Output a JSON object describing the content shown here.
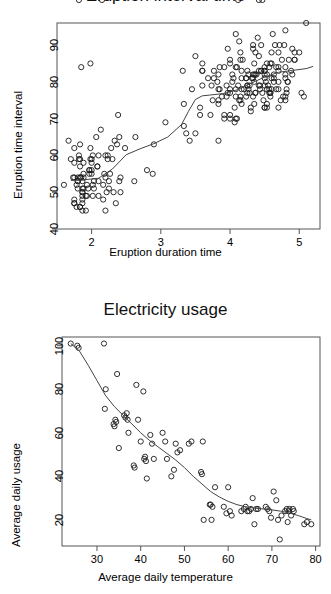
{
  "page": {
    "background": "#ffffff",
    "point_color": "#1a1a1a",
    "line_color": "#444444",
    "axis_color": "#555555",
    "width": 331,
    "height": 594
  },
  "figures": [
    {
      "id": "eruption-figure",
      "title": "Eruption interval time",
      "title_clipped": true
    },
    {
      "id": "electricity-figure",
      "title": "Electricity usage",
      "title_clipped": false
    }
  ],
  "chart_data": [
    {
      "type": "scatter",
      "title": "Eruption interval time",
      "xlabel": "Eruption duration time",
      "ylabel": "Eruption time interval",
      "xlim": [
        1.5,
        5.3
      ],
      "ylim": [
        40,
        96
      ],
      "xticks": [
        2,
        3,
        4,
        5
      ],
      "yticks": [
        40,
        50,
        60,
        70,
        80,
        90
      ],
      "grid": false,
      "legend": "none",
      "marker": "open-circle",
      "overlay": {
        "type": "line",
        "name": "lowess smoother",
        "x": [
          1.7,
          1.9,
          2.1,
          2.3,
          2.5,
          2.7,
          2.9,
          3.1,
          3.3,
          3.4,
          3.5,
          3.6,
          3.7,
          3.9,
          4.1,
          4.3,
          4.5,
          4.7,
          4.9,
          5.1,
          5.2
        ],
        "y": [
          53.2,
          53.4,
          53.8,
          56.3,
          60.2,
          61.8,
          63.2,
          65.0,
          68.4,
          72.0,
          75.2,
          76.2,
          76.4,
          76.8,
          77.8,
          79.6,
          81.3,
          82.6,
          83.1,
          83.6,
          84.2
        ]
      },
      "x": [
        3.6,
        1.8,
        3.333,
        2.283,
        4.533,
        2.883,
        4.7,
        3.6,
        1.95,
        4.35,
        1.833,
        3.917,
        4.2,
        1.75,
        4.7,
        2.167,
        1.75,
        4.8,
        1.6,
        4.25,
        1.8,
        1.75,
        3.45,
        3.067,
        4.533,
        3.6,
        1.967,
        4.083,
        3.85,
        4.433,
        4.3,
        4.467,
        3.367,
        4.033,
        3.833,
        2.017,
        1.867,
        4.833,
        1.833,
        4.783,
        4.35,
        1.883,
        4.567,
        1.75,
        4.533,
        3.317,
        3.833,
        2.1,
        4.633,
        2.0,
        4.8,
        4.716,
        1.833,
        4.833,
        1.733,
        4.883,
        3.717,
        1.667,
        4.567,
        4.317,
        2.233,
        4.5,
        1.75,
        4.8,
        1.817,
        4.4,
        4.167,
        4.7,
        2.067,
        4.7,
        4.033,
        1.967,
        4.5,
        4.0,
        1.983,
        5.067,
        2.017,
        4.567,
        3.883,
        3.6,
        4.133,
        4.333,
        4.1,
        2.633,
        4.067,
        4.933,
        3.95,
        4.517,
        2.167,
        4.0,
        2.2,
        4.333,
        1.867,
        4.817,
        1.833,
        4.3,
        4.667,
        3.75,
        1.867,
        4.9,
        2.483,
        4.367,
        2.1,
        4.5,
        4.05,
        1.867,
        4.7,
        1.783,
        4.85,
        3.683,
        4.733,
        2.3,
        4.9,
        4.417,
        1.7,
        4.633,
        2.317,
        4.6,
        1.817,
        4.417,
        2.617,
        4.067,
        4.25,
        1.967,
        4.6,
        3.767,
        1.917,
        4.5,
        2.267,
        4.65,
        1.867,
        4.167,
        2.8,
        4.333,
        1.833,
        4.383,
        1.883,
        4.933,
        2.033,
        3.733,
        4.233,
        2.233,
        4.533,
        4.817,
        4.333,
        1.983,
        4.633,
        2.017,
        5.1,
        1.8,
        5.033,
        4.0,
        2.4,
        4.6,
        3.567,
        4.0,
        4.5,
        4.083,
        1.8,
        3.967,
        2.2,
        4.15,
        2.0,
        3.833,
        3.5,
        4.583,
        2.367,
        5.0,
        1.933,
        4.617,
        1.917,
        2.083,
        4.583,
        3.333,
        4.167,
        4.333,
        4.5,
        2.417,
        4.0,
        4.167,
        1.883,
        4.583,
        4.25,
        3.767,
        2.033,
        4.433,
        4.083,
        1.833,
        4.417,
        2.183,
        4.8,
        1.833,
        4.8,
        4.1,
        3.966,
        4.233,
        3.5,
        4.366,
        2.25,
        4.667,
        2.1,
        4.35,
        4.133,
        1.867,
        4.6,
        1.783,
        4.367,
        3.85,
        1.933,
        4.5,
        2.383,
        4.7,
        1.867,
        3.833,
        3.417,
        4.233,
        2.4,
        4.8,
        2.0,
        4.15,
        1.867,
        4.267,
        1.75,
        4.483,
        4.0,
        4.117,
        4.083,
        4.267,
        3.917,
        4.55,
        4.083,
        2.417,
        4.183,
        2.217,
        4.45,
        1.883,
        1.85,
        4.283,
        3.95,
        2.333,
        4.15,
        2.35,
        4.933,
        2.9,
        4.583,
        3.833,
        2.083,
        4.367,
        2.133,
        4.35,
        2.2,
        4.45,
        3.567,
        4.5,
        4.15,
        3.817,
        3.917,
        4.45,
        2.0,
        4.283,
        4.767,
        4.533,
        1.85,
        4.25,
        1.983,
        2.25,
        4.75,
        4.117,
        2.15,
        4.417,
        1.817,
        4.467
      ],
      "y": [
        79,
        54,
        74,
        62,
        85,
        55,
        88,
        85,
        51,
        85,
        54,
        84,
        78,
        47,
        83,
        52,
        62,
        84,
        52,
        79,
        51,
        47,
        78,
        69,
        74,
        83,
        55,
        76,
        78,
        79,
        73,
        77,
        66,
        80,
        74,
        52,
        48,
        80,
        59,
        90,
        80,
        58,
        84,
        58,
        73,
        83,
        64,
        53,
        82,
        59,
        75,
        90,
        54,
        80,
        54,
        83,
        71,
        64,
        77,
        81,
        59,
        84,
        48,
        82,
        60,
        92,
        78,
        78,
        65,
        73,
        82,
        56,
        79,
        71,
        62,
        76,
        60,
        78,
        76,
        83,
        75,
        82,
        70,
        65,
        73,
        88,
        76,
        80,
        48,
        86,
        60,
        90,
        50,
        78,
        63,
        72,
        84,
        75,
        51,
        82,
        62,
        88,
        49,
        83,
        81,
        47,
        84,
        52,
        86,
        81,
        75,
        59,
        89,
        79,
        59,
        81,
        50,
        85,
        59,
        87,
        53,
        69,
        77,
        56,
        88,
        81,
        45,
        82,
        55,
        90,
        45,
        83,
        56,
        89,
        46,
        82,
        51,
        86,
        53,
        79,
        81,
        60,
        82,
        77,
        76,
        59,
        80,
        49,
        96,
        53,
        77,
        77,
        65,
        81,
        71,
        70,
        81,
        93,
        53,
        89,
        45,
        86,
        58,
        78,
        66,
        76,
        63,
        88,
        52,
        93,
        49,
        57,
        77,
        68,
        81,
        81,
        73,
        50,
        85,
        74,
        55,
        77,
        83,
        83,
        51,
        78,
        84,
        46,
        83,
        55,
        81,
        57,
        76,
        84,
        77,
        81,
        87,
        77,
        51,
        78,
        60,
        82,
        91,
        53,
        78,
        46,
        77,
        84,
        49,
        83,
        71,
        80,
        49,
        75,
        64,
        76,
        53,
        94,
        55,
        76,
        50,
        82,
        54,
        75,
        78,
        79,
        78,
        78,
        70,
        79,
        70,
        54,
        86,
        50,
        90,
        54,
        54,
        77,
        79,
        64,
        75,
        47,
        86,
        63,
        85,
        82,
        57,
        82,
        67,
        74,
        54,
        83,
        73,
        73,
        88,
        80,
        71,
        83,
        56,
        79,
        76,
        78,
        84,
        79,
        85,
        53,
        86
      ]
    },
    {
      "type": "scatter",
      "title": "Electricity usage",
      "xlabel": "Average daily temperature",
      "ylabel": "Average daily usage",
      "xlim": [
        22,
        81
      ],
      "ylim": [
        8,
        104
      ],
      "xticks": [
        30,
        40,
        50,
        60,
        70,
        80
      ],
      "yticks": [
        20,
        40,
        60,
        80,
        100
      ],
      "grid": false,
      "legend": "none",
      "marker": "open-circle",
      "overlay": {
        "type": "line",
        "name": "lowess smoother",
        "x": [
          24,
          26,
          28,
          30,
          32,
          34,
          36,
          38,
          40,
          42,
          44,
          46,
          48,
          50,
          52,
          54,
          56,
          58,
          60,
          62,
          64,
          66,
          68,
          70,
          72,
          74,
          76,
          78,
          79
        ],
        "y": [
          101.0,
          97.5,
          91.0,
          84.0,
          77.0,
          72.0,
          68.0,
          64.0,
          60.0,
          56.5,
          53.5,
          50.5,
          47.5,
          44.0,
          40.0,
          36.5,
          33.0,
          30.5,
          28.5,
          27.0,
          26.0,
          25.4,
          25.0,
          24.6,
          24.0,
          23.2,
          22.0,
          20.6,
          20.0
        ]
      },
      "x": [
        24.0,
        25.5,
        25.8,
        31.6,
        31.8,
        32.0,
        33.8,
        34.0,
        34.2,
        34.4,
        34.6,
        35.0,
        36.2,
        36.5,
        36.8,
        37.0,
        37.2,
        38.4,
        38.6,
        39.0,
        39.4,
        40.0,
        40.6,
        40.8,
        41.0,
        41.2,
        41.4,
        42.2,
        42.6,
        43.0,
        45.0,
        45.6,
        46.0,
        47.0,
        47.6,
        48.0,
        48.4,
        49.0,
        51.0,
        51.6,
        53.8,
        54.0,
        54.2,
        54.4,
        55.8,
        56.0,
        56.2,
        56.4,
        57.0,
        59.0,
        59.6,
        60.0,
        60.4,
        60.8,
        63.0,
        63.6,
        64.0,
        64.4,
        64.8,
        65.2,
        65.6,
        66.0,
        66.4,
        66.8,
        68.6,
        69.0,
        69.4,
        69.8,
        70.4,
        71.0,
        71.4,
        71.8,
        72.2,
        73.0,
        73.4,
        73.6,
        73.8,
        74.0,
        74.4,
        74.8,
        75.0,
        77.4,
        78.0,
        79.0
      ],
      "y": [
        101,
        100,
        99,
        101,
        71,
        80,
        64,
        63,
        66,
        65,
        87,
        53,
        68,
        67,
        69,
        66,
        60,
        45,
        44,
        82,
        66,
        56,
        79,
        48,
        49,
        47,
        39,
        59,
        55,
        48,
        60,
        56,
        48,
        40,
        43,
        55,
        51,
        52,
        55,
        56,
        42,
        41,
        56,
        20,
        27,
        27,
        20,
        26,
        35,
        26,
        23,
        35,
        24,
        22,
        24,
        25,
        26,
        24,
        24,
        25,
        30,
        18,
        25,
        25,
        26,
        25,
        24,
        21,
        33,
        29,
        20,
        11,
        22,
        24,
        25,
        19,
        24,
        25,
        22,
        25,
        24,
        18,
        19,
        18
      ]
    }
  ]
}
